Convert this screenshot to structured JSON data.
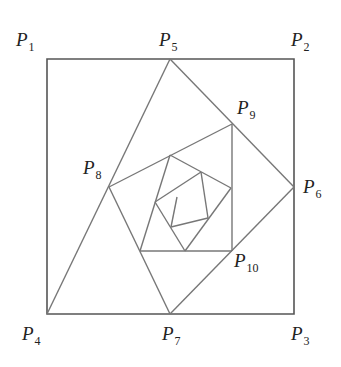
{
  "figure": {
    "type": "nested rotated squares spiral",
    "stroke_color": "#777777",
    "square_stroke_color": "#555555",
    "points": {
      "P1": {
        "label": "P",
        "sub": "1",
        "x": 47,
        "y": 59,
        "label_x": 16,
        "label_y": 30
      },
      "P2": {
        "label": "P",
        "sub": "2",
        "x": 294,
        "y": 59,
        "label_x": 292,
        "label_y": 30
      },
      "P3": {
        "label": "P",
        "sub": "3",
        "x": 294,
        "y": 314,
        "label_x": 292,
        "label_y": 325
      },
      "P4": {
        "label": "P",
        "sub": "4",
        "x": 47,
        "y": 314,
        "label_x": 22,
        "label_y": 325
      },
      "P5": {
        "label": "P",
        "sub": "5",
        "x": 170,
        "y": 59,
        "label_x": 160,
        "label_y": 30
      },
      "P6": {
        "label": "P",
        "sub": "6",
        "x": 294,
        "y": 187,
        "label_x": 303,
        "label_y": 177
      },
      "P7": {
        "label": "P",
        "sub": "7",
        "x": 170,
        "y": 314,
        "label_x": 162,
        "label_y": 325
      },
      "P8": {
        "label": "P",
        "sub": "8",
        "x": 109,
        "y": 187,
        "label_x": 83,
        "label_y": 158
      },
      "P9": {
        "label": "P",
        "sub": "9",
        "x": 232,
        "y": 124,
        "label_x": 237,
        "label_y": 98
      },
      "P10": {
        "label": "P",
        "sub": "10",
        "x": 232,
        "y": 251,
        "label_x": 233,
        "label_y": 252
      }
    },
    "labels": [
      {
        "id": "P1",
        "text": "P",
        "sub": "1"
      },
      {
        "id": "P2",
        "text": "P",
        "sub": "2"
      },
      {
        "id": "P3",
        "text": "P",
        "sub": "3"
      },
      {
        "id": "P4",
        "text": "P",
        "sub": "4"
      },
      {
        "id": "P5",
        "text": "P",
        "sub": "5"
      },
      {
        "id": "P6",
        "text": "P",
        "sub": "6"
      },
      {
        "id": "P7",
        "text": "P",
        "sub": "7"
      },
      {
        "id": "P8",
        "text": "P",
        "sub": "8"
      },
      {
        "id": "P9",
        "text": "P",
        "sub": "9"
      },
      {
        "id": "P10",
        "text": "P",
        "sub": "10"
      }
    ]
  }
}
